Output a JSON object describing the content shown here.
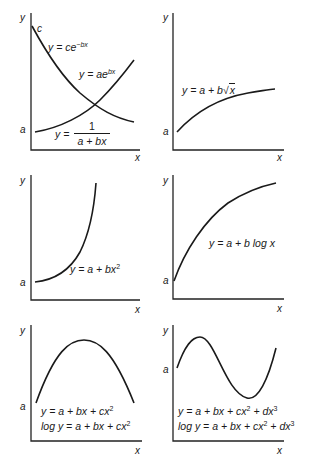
{
  "figure": {
    "axis_labels": {
      "x": "x",
      "y": "y"
    },
    "panels": [
      {
        "id": "exponential",
        "intercept_labels": [
          "c",
          "a"
        ],
        "equations": [
          "y = ce^{-bx}",
          "y = ae^{bx}",
          "y = 1/(a + bx)"
        ],
        "eq1": {
          "pre": "y = ce",
          "sup": "−bx"
        },
        "eq2": {
          "pre": "y = ae",
          "sup": "bx"
        },
        "eq3": {
          "lhs": "y =",
          "num": "1",
          "den": "a + bx"
        }
      },
      {
        "id": "sqrt",
        "intercept_labels": [
          "a"
        ],
        "equation": {
          "pre": "y = a + b",
          "sqrt_sym": "√",
          "radicand": "x"
        }
      },
      {
        "id": "quadratic",
        "intercept_labels": [
          "a"
        ],
        "equation": {
          "pre": "y = a + bx",
          "sup": "2"
        }
      },
      {
        "id": "log",
        "intercept_labels": [
          "a"
        ],
        "equation": {
          "pre": "y = a + b log x"
        }
      },
      {
        "id": "parabola",
        "intercept_labels": [
          "a"
        ],
        "equations": {
          "line1": {
            "pre": "y = a + bx + cx",
            "sup": "2"
          },
          "line2": {
            "pre": "log y = a + bx + cx",
            "sup": "2"
          }
        }
      },
      {
        "id": "cubic",
        "intercept_labels": [
          "a"
        ],
        "equations": {
          "line1": {
            "pre": "y = a + bx + cx",
            "sup1": "2",
            "mid": " + dx",
            "sup2": "3"
          },
          "line2": {
            "pre": "log y = a + bx + cx",
            "sup1": "2",
            "mid": " + dx",
            "sup2": "3"
          }
        }
      }
    ]
  }
}
